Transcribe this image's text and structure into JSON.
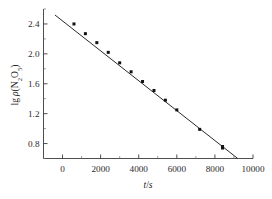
{
  "chart_data": {
    "type": "scatter",
    "title": "",
    "xlabel": "t/s",
    "ylabel": "lg p(N2O5)",
    "ylabel_parts": {
      "lead": "lg ",
      "rho": "p",
      "species_pre": "(N",
      "sub1": "2",
      "mid": "O",
      "sub2": "5",
      "close": ")"
    },
    "xlim": [
      -1000,
      10000
    ],
    "ylim": [
      0.6,
      2.6
    ],
    "xticks": [
      0,
      2000,
      4000,
      6000,
      8000,
      10000
    ],
    "xtick_labels": [
      "0",
      "2000",
      "4000",
      "6000",
      "8000",
      "10000"
    ],
    "yticks": [
      0.8,
      1.2,
      1.6,
      2.0,
      2.4
    ],
    "ytick_labels": [
      "0.8",
      "1.2",
      "1.6",
      "2.0",
      "2.4"
    ],
    "x_minor_step": 1000,
    "y_minor_step": 0.2,
    "grid": false,
    "legend": null,
    "marker": "filled-square",
    "marker_color": "#111111",
    "line_color": "#2a2a2a",
    "x": [
      600,
      1200,
      1800,
      2400,
      3000,
      3600,
      4200,
      4800,
      5400,
      6000,
      7200,
      8400,
      8400
    ],
    "y": [
      2.4,
      2.27,
      2.15,
      2.02,
      1.88,
      1.76,
      1.63,
      1.51,
      1.38,
      1.25,
      0.99,
      0.74,
      0.76
    ],
    "fit_line": {
      "x0": -400,
      "y0": 2.52,
      "x1": 9200,
      "y1": 0.6,
      "slope": -0.0002,
      "intercept": 2.44
    }
  },
  "axes": {
    "x_axis_name": "t/s",
    "y_axis_name": "lg p(N2O5)"
  }
}
